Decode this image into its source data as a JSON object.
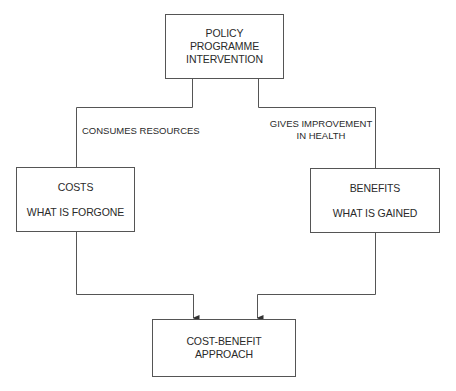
{
  "diagram": {
    "top": {
      "lines": [
        "POLICY",
        "PROGRAMME",
        "INTERVENTION"
      ]
    },
    "left_edge_label": "CONSUMES RESOURCES",
    "right_edge_label": {
      "lines": [
        "GIVES IMPROVEMENT",
        "IN HEALTH"
      ]
    },
    "costs": {
      "title": "COSTS",
      "subtitle": "WHAT IS FORGONE"
    },
    "benefits": {
      "title": "BENEFITS",
      "subtitle": "WHAT IS GAINED"
    },
    "result": {
      "lines": [
        "COST-BENEFIT",
        "APPROACH"
      ]
    }
  },
  "colors": {
    "line": "#555555",
    "text": "#2a2a2a",
    "background": "#ffffff"
  }
}
